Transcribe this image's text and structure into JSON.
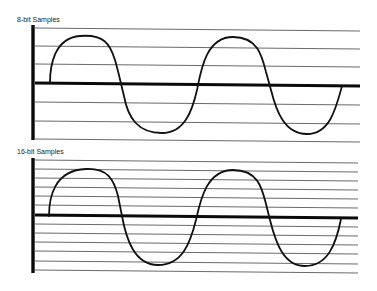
{
  "panels": [
    {
      "label": "8-bit Samples",
      "label_pos": [
        17,
        16
      ],
      "axis_x": 33,
      "axis_top": 25,
      "axis_bottom": 140,
      "line_x_start": 35,
      "line_x_end": 360,
      "levels_left": [
        28,
        46,
        64,
        83,
        102,
        121,
        139
      ],
      "levels_slope": 3,
      "zero_index": 3,
      "wave": "M50,83 C50,66 54,38 80,36 C104,34 110,44 115,60 C119,74 121,84 124,96 C128,118 138,133 162,133 C184,133 192,112 197,90 C201,70 206,37 233,37 C258,37 262,56 266,72 L271,90 C276,110 284,134 307,134 C330,134 336,108 342,86"
    },
    {
      "label": "16-bit Samples",
      "label_pos": [
        17,
        148
      ],
      "axis_x": 33,
      "axis_top": 158,
      "axis_bottom": 273,
      "line_x_start": 35,
      "line_x_end": 358,
      "levels_left": [
        160,
        169,
        178,
        187,
        196,
        205,
        215,
        224,
        233,
        242,
        251,
        261,
        270
      ],
      "levels_slope": 3,
      "zero_index": 6,
      "wave": "M49,216 C49,198 54,170 86,169 C108,168 114,180 118,196 L122,216 C126,238 134,265 158,265 C182,265 190,244 196,220 C200,202 206,170 233,170 C258,170 262,188 266,204 L270,220 C276,244 284,266 305,266 C328,266 336,244 341,219"
    }
  ],
  "colors": {
    "line": "#6a6a6a",
    "axis": "#0a0a0a",
    "wave": "#111111",
    "background": "#ffffff"
  }
}
